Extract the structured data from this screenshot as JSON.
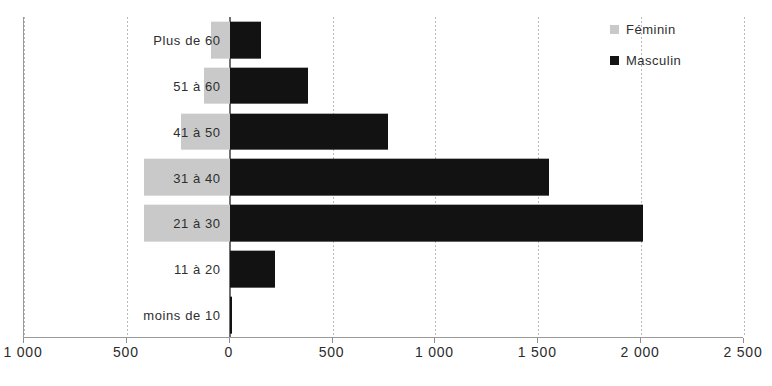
{
  "chart_data": {
    "type": "bar",
    "subtype": "population-pyramid",
    "orientation": "horizontal",
    "diverging": true,
    "title": "",
    "subtitle": "",
    "xlabel": "",
    "ylabel": "",
    "grid": true,
    "legend_position": "top-right",
    "categories": [
      "Plus de 60",
      "51 à 60",
      "41 à 50",
      "31 à 40",
      "21 à 30",
      "11 à 20",
      "moins de 10"
    ],
    "series": [
      {
        "name": "Féminin",
        "color": "#c9c9c9",
        "direction": "left",
        "values": [
          90,
          125,
          235,
          415,
          415,
          0,
          0
        ]
      },
      {
        "name": "Masculin",
        "color": "#121212",
        "direction": "right",
        "values": [
          150,
          380,
          770,
          1550,
          2010,
          220,
          10
        ]
      }
    ],
    "xlim": [
      -1000,
      2500
    ],
    "xticks": [
      -1000,
      -500,
      0,
      500,
      1000,
      1500,
      2000,
      2500
    ],
    "xtick_labels": [
      "1 000",
      "500",
      "0",
      "500",
      "1 000",
      "1 500",
      "2 000",
      "2 500"
    ]
  },
  "legend": {
    "items": [
      {
        "label": "Féminin",
        "swatch": "feminin-swatch"
      },
      {
        "label": "Masculin",
        "swatch": "masculin-swatch"
      }
    ]
  },
  "axis": {
    "tick_labels": [
      "1 000",
      "500",
      "0",
      "500",
      "1 000",
      "1 500",
      "2 000",
      "2 500"
    ]
  },
  "categories": [
    "Plus de 60",
    "51 à 60",
    "41 à 50",
    "31 à 40",
    "21 à 30",
    "11 à 20",
    "moins de 10"
  ],
  "colors": {
    "feminin": "#c9c9c9",
    "masculin": "#121212",
    "grid": "#b9b9b9",
    "axis": "#9a9a9a",
    "background": "#ffffff"
  }
}
